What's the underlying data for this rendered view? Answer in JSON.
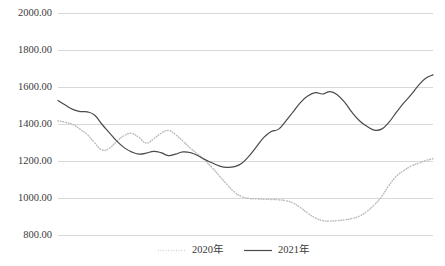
{
  "chart_data": {
    "type": "line",
    "title": "",
    "xlabel": "",
    "ylabel": "",
    "ylim": [
      800,
      2000
    ],
    "ytick_labels": [
      "2000.00",
      "1800.00",
      "1600.00",
      "1400.00",
      "1200.00",
      "1000.00",
      "800.00"
    ],
    "ytick_values": [
      2000,
      1800,
      1600,
      1400,
      1200,
      1000,
      800
    ],
    "grid": true,
    "legend_position": "bottom-center",
    "x": [
      1,
      2,
      3,
      4,
      5,
      6,
      7,
      8,
      9,
      10,
      11,
      12,
      13,
      14,
      15,
      16,
      17,
      18,
      19,
      20,
      21,
      22,
      23,
      24,
      25,
      26,
      27,
      28,
      29,
      30,
      31,
      32,
      33,
      34,
      35,
      36,
      37,
      38,
      39,
      40,
      41,
      42,
      43,
      44,
      45,
      46,
      47,
      48,
      49,
      50,
      51,
      52
    ],
    "series": [
      {
        "name": "2020年",
        "style": "dotted",
        "color": "#bdbdbd",
        "values": [
          1420,
          1412,
          1400,
          1375,
          1345,
          1300,
          1262,
          1272,
          1310,
          1340,
          1352,
          1330,
          1300,
          1322,
          1352,
          1368,
          1345,
          1310,
          1272,
          1240,
          1205,
          1165,
          1120,
          1075,
          1035,
          1010,
          1000,
          998,
          996,
          995,
          993,
          988,
          975,
          950,
          920,
          895,
          880,
          878,
          880,
          885,
          892,
          905,
          930,
          965,
          1010,
          1070,
          1120,
          1150,
          1175,
          1190,
          1205,
          1215
        ]
      },
      {
        "name": "2021年",
        "style": "solid",
        "color": "#4a4a4a",
        "values": [
          1530,
          1505,
          1482,
          1470,
          1468,
          1450,
          1400,
          1355,
          1310,
          1275,
          1252,
          1240,
          1245,
          1255,
          1248,
          1232,
          1240,
          1252,
          1248,
          1232,
          1210,
          1192,
          1175,
          1168,
          1172,
          1190,
          1230,
          1280,
          1330,
          1362,
          1375,
          1420,
          1470,
          1520,
          1555,
          1572,
          1565,
          1578,
          1560,
          1520,
          1465,
          1420,
          1390,
          1370,
          1375,
          1412,
          1465,
          1515,
          1560,
          1610,
          1650,
          1668
        ]
      }
    ],
    "legend": [
      {
        "label": "2020年",
        "style": "dotted",
        "color": "#bdbdbd"
      },
      {
        "label": "2021年",
        "style": "solid",
        "color": "#4a4a4a"
      }
    ]
  }
}
